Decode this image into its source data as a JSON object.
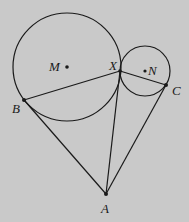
{
  "diagram": {
    "background": "#c9c9c9",
    "stroke": "#1a1a1a",
    "labels": {
      "M": "M",
      "N": "N",
      "X": "X",
      "B": "B",
      "C": "C",
      "A": "A"
    },
    "circles": [
      {
        "name": "circle-M",
        "center": "M",
        "cx": 67,
        "cy": 67,
        "r": 54
      },
      {
        "name": "circle-N",
        "center": "N",
        "cx": 145,
        "cy": 71,
        "r": 25
      }
    ],
    "points": {
      "M": [
        67,
        67
      ],
      "N": [
        145,
        71
      ],
      "X": [
        120,
        71
      ],
      "B": [
        24,
        100
      ],
      "C": [
        166,
        85
      ],
      "A": [
        106,
        194
      ]
    },
    "segments": [
      "BX",
      "XC",
      "BA",
      "XA",
      "CA"
    ]
  }
}
